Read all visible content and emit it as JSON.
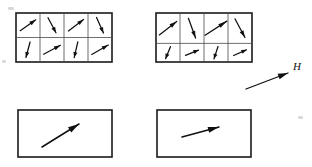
{
  "figure": {
    "background_color": "#ffffff",
    "ink_color": "#101010",
    "divider_color": "#4a4a4a",
    "width": 312,
    "height": 167
  },
  "field": {
    "label": "H",
    "arrow": {
      "x1": 246,
      "y1": 89,
      "x2": 288,
      "y2": 73
    },
    "label_position": {
      "x": 293,
      "y": 70
    }
  },
  "panels": [
    {
      "id": "panel-top-left",
      "name": "unmagnetized-domain-grid",
      "frame": {
        "x": 16,
        "y": 13,
        "width": 96,
        "height": 49
      },
      "grid": {
        "columns": 4,
        "rows": 2,
        "row_split": 0.5
      },
      "cells": [
        {
          "row": 0,
          "col": 0,
          "angle_deg": -35,
          "length": 19
        },
        {
          "row": 0,
          "col": 1,
          "angle_deg": 62,
          "length": 17
        },
        {
          "row": 0,
          "col": 2,
          "angle_deg": -37,
          "length": 19
        },
        {
          "row": 0,
          "col": 3,
          "angle_deg": 66,
          "length": 17
        },
        {
          "row": 1,
          "col": 0,
          "angle_deg": 105,
          "length": 16
        },
        {
          "row": 1,
          "col": 1,
          "angle_deg": -28,
          "length": 19
        },
        {
          "row": 1,
          "col": 2,
          "angle_deg": 103,
          "length": 16
        },
        {
          "row": 1,
          "col": 3,
          "angle_deg": -30,
          "length": 19
        }
      ]
    },
    {
      "id": "panel-top-right",
      "name": "partially-aligned-domain-grid",
      "frame": {
        "x": 156,
        "y": 13,
        "width": 96,
        "height": 49
      },
      "grid": {
        "columns": 4,
        "rows": 2,
        "row_split": 0.62
      },
      "cells": [
        {
          "row": 0,
          "col": 0,
          "angle_deg": -38,
          "length": 22
        },
        {
          "row": 0,
          "col": 1,
          "angle_deg": 70,
          "length": 21
        },
        {
          "row": 0,
          "col": 2,
          "angle_deg": -33,
          "length": 26
        },
        {
          "row": 0,
          "col": 3,
          "angle_deg": 62,
          "length": 21
        },
        {
          "row": 1,
          "col": 0,
          "angle_deg": 112,
          "length": 13
        },
        {
          "row": 1,
          "col": 1,
          "angle_deg": -22,
          "length": 14
        },
        {
          "row": 1,
          "col": 2,
          "angle_deg": 108,
          "length": 13
        },
        {
          "row": 1,
          "col": 3,
          "angle_deg": -24,
          "length": 14
        }
      ]
    },
    {
      "id": "panel-bottom-left",
      "name": "net-magnetization-box-left",
      "frame": {
        "x": 18,
        "y": 110,
        "width": 94,
        "height": 47
      },
      "grid": null,
      "net_vector": {
        "x1": 42,
        "y1": 147,
        "x2": 79,
        "y2": 124
      }
    },
    {
      "id": "panel-bottom-right",
      "name": "net-magnetization-box-right",
      "frame": {
        "x": 157,
        "y": 110,
        "width": 94,
        "height": 47
      },
      "grid": null,
      "net_vector": {
        "x1": 182,
        "y1": 137,
        "x2": 219,
        "y2": 127
      }
    }
  ],
  "specks": [
    {
      "x": 8,
      "y": 7,
      "w": 6,
      "h": 3
    },
    {
      "x": 298,
      "y": 116,
      "w": 5,
      "h": 3
    },
    {
      "x": 2,
      "y": 60,
      "w": 4,
      "h": 3
    }
  ]
}
